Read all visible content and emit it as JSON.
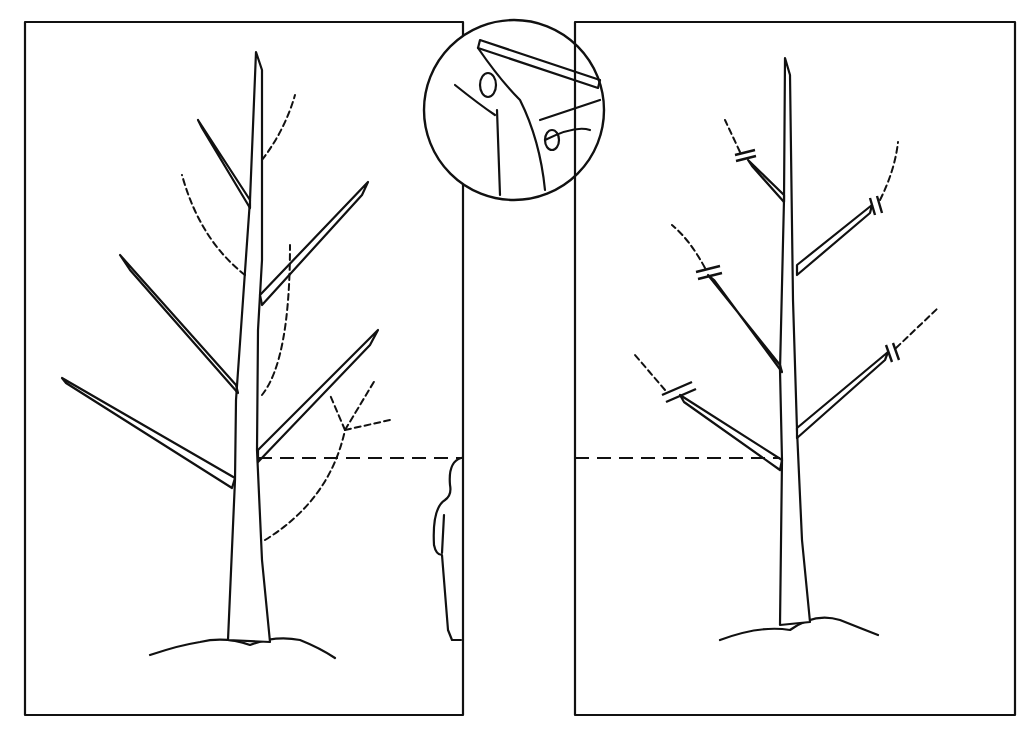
{
  "diagram": {
    "panels": [
      {
        "id": "before",
        "description": "tree before pruning, dashed branches to remove"
      },
      {
        "id": "after",
        "description": "tree after pruning, branches shortened with cut marks"
      }
    ],
    "inset": {
      "description": "pruning shears cutting a branch"
    },
    "figure": {
      "description": "person silhouette showing height reference"
    },
    "colors": {
      "ink": "#111111",
      "background": "#ffffff"
    }
  }
}
